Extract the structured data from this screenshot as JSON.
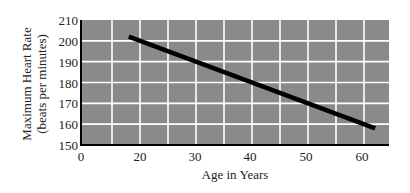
{
  "chart_data": {
    "type": "line",
    "title": "",
    "xlabel": "Age in Years",
    "ylabel": "Maximum Heart Rate (beats per minutes)",
    "ylabel_lines": [
      "Maximum Heart Rate",
      "(beats per minutes)"
    ],
    "x_ticks": [
      "0",
      "20",
      "30",
      "40",
      "50",
      "60"
    ],
    "y_ticks": [
      "150",
      "160",
      "170",
      "180",
      "190",
      "200",
      "210"
    ],
    "ylim": [
      150,
      210
    ],
    "xlim": [
      10,
      65
    ],
    "grid": true,
    "legend": null,
    "series": [
      {
        "name": "Maximum Heart Rate",
        "x": [
          18,
          62
        ],
        "y": [
          202,
          158
        ]
      }
    ],
    "colors": {
      "plot_background": "#8a8a8a",
      "grid": "#ffffff",
      "line": "#000000",
      "axis": "#000000"
    }
  }
}
